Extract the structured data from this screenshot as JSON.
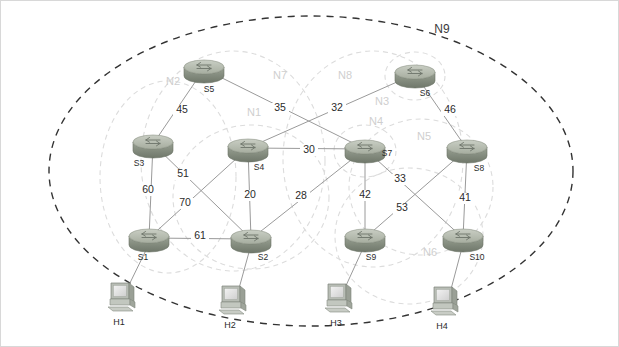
{
  "diagram": {
    "type": "network-graph",
    "outer_zone_label": "N9",
    "colors": {
      "link": "#9a9a9a",
      "zone_dashed": "#dcdcdc",
      "outer_zone_dashed": "#333333",
      "router_body": "#8a9287",
      "router_top": "#b9bfb4",
      "label_text": "#2b2b2b",
      "zone_label_text": "#cfcfcf",
      "background": "#ffffff"
    }
  },
  "routers": [
    {
      "id": "S1",
      "label": "S1",
      "x": 148,
      "y": 237,
      "label_dx": -6,
      "label_dy": 22
    },
    {
      "id": "S2",
      "label": "S2",
      "x": 250,
      "y": 238,
      "label_dx": 12,
      "label_dy": 21
    },
    {
      "id": "S3",
      "label": "S3",
      "x": 152,
      "y": 143,
      "label_dx": -14,
      "label_dy": 22
    },
    {
      "id": "S4",
      "label": "S4",
      "x": 247,
      "y": 147,
      "label_dx": 11,
      "label_dy": 22
    },
    {
      "id": "S5",
      "label": "S5",
      "x": 203,
      "y": 68,
      "label_dx": 5,
      "label_dy": 23
    },
    {
      "id": "S6",
      "label": "S6",
      "x": 414,
      "y": 73,
      "label_dx": 10,
      "label_dy": 22
    },
    {
      "id": "S7",
      "label": "S7",
      "x": 364,
      "y": 148,
      "label_dx": 22,
      "label_dy": 7
    },
    {
      "id": "S8",
      "label": "S8",
      "x": 466,
      "y": 148,
      "label_dx": 12,
      "label_dy": 22
    },
    {
      "id": "S9",
      "label": "S9",
      "x": 364,
      "y": 237,
      "label_dx": 6,
      "label_dy": 22
    },
    {
      "id": "S10",
      "label": "S10",
      "x": 462,
      "y": 237,
      "label_dx": 14,
      "label_dy": 22
    }
  ],
  "hosts": [
    {
      "id": "H1",
      "label": "H1",
      "x": 120,
      "y": 296,
      "label_dx": -2,
      "label_dy": 28
    },
    {
      "id": "H2",
      "label": "H2",
      "x": 231,
      "y": 299,
      "label_dx": -2,
      "label_dy": 28
    },
    {
      "id": "H3",
      "label": "H3",
      "x": 337,
      "y": 297,
      "label_dx": -2,
      "label_dy": 28
    },
    {
      "id": "H4",
      "label": "H4",
      "x": 443,
      "y": 300,
      "label_dx": -2,
      "label_dy": 28
    }
  ],
  "links": [
    {
      "from": "S3",
      "to": "S5",
      "weight": "45",
      "lx": 181,
      "ly": 112
    },
    {
      "from": "S5",
      "to": "S7",
      "weight": "35",
      "lx": 279,
      "ly": 110
    },
    {
      "from": "S4",
      "to": "S6",
      "weight": "32",
      "lx": 336,
      "ly": 110
    },
    {
      "from": "S4",
      "to": "S7",
      "weight": "30",
      "lx": 308,
      "ly": 152
    },
    {
      "from": "S6",
      "to": "S8",
      "weight": "46",
      "lx": 449,
      "ly": 112
    },
    {
      "from": "S3",
      "to": "S1",
      "weight": "60",
      "lx": 147,
      "ly": 192
    },
    {
      "from": "S3",
      "to": "S2",
      "weight": "51",
      "lx": 182,
      "ly": 176
    },
    {
      "from": "S4",
      "to": "S1",
      "weight": "70",
      "lx": 184,
      "ly": 205
    },
    {
      "from": "S4",
      "to": "S2",
      "weight": "20",
      "lx": 249,
      "ly": 197
    },
    {
      "from": "S1",
      "to": "S2",
      "weight": "61",
      "lx": 199,
      "ly": 238
    },
    {
      "from": "S2",
      "to": "S7",
      "weight": "28",
      "lx": 300,
      "ly": 198
    },
    {
      "from": "S7",
      "to": "S9",
      "weight": "42",
      "lx": 364,
      "ly": 197
    },
    {
      "from": "S7",
      "to": "S10",
      "weight": "33",
      "lx": 399,
      "ly": 181
    },
    {
      "from": "S8",
      "to": "S9",
      "weight": "53",
      "lx": 401,
      "ly": 210
    },
    {
      "from": "S8",
      "to": "S10",
      "weight": "41",
      "lx": 464,
      "ly": 200
    }
  ],
  "host_links": [
    {
      "from": "S1",
      "to": "H1"
    },
    {
      "from": "S2",
      "to": "H2"
    },
    {
      "from": "S9",
      "to": "H3"
    },
    {
      "from": "S10",
      "to": "H4"
    }
  ],
  "zones": [
    {
      "id": "N1",
      "label": "N1",
      "cx": 250,
      "cy": 196,
      "rx": 78,
      "ry": 72,
      "rot": 0,
      "lx": 253,
      "ly": 115
    },
    {
      "id": "N2",
      "label": "N2",
      "cx": 167,
      "cy": 176,
      "rx": 68,
      "ry": 96,
      "rot": 0,
      "lx": 172,
      "ly": 84
    },
    {
      "id": "N3",
      "label": "N3",
      "cx": 414,
      "cy": 75,
      "rx": 30,
      "ry": 24,
      "rot": 0,
      "lx": 381,
      "ly": 104
    },
    {
      "id": "N4",
      "label": "N4",
      "cx": 364,
      "cy": 150,
      "rx": 31,
      "ry": 26,
      "rot": 0,
      "lx": 375,
      "ly": 124
    },
    {
      "id": "N5",
      "label": "N5",
      "cx": 420,
      "cy": 186,
      "rx": 72,
      "ry": 68,
      "rot": 0,
      "lx": 423,
      "ly": 139
    },
    {
      "id": "N6",
      "label": "N6",
      "cx": 408,
      "cy": 235,
      "rx": 74,
      "ry": 68,
      "rot": 0,
      "lx": 429,
      "ly": 255
    },
    {
      "id": "N7",
      "label": "N7",
      "cx": 232,
      "cy": 160,
      "rx": 92,
      "ry": 110,
      "rot": 0,
      "lx": 279,
      "ly": 78
    },
    {
      "id": "N8",
      "label": "N8",
      "cx": 372,
      "cy": 158,
      "rx": 90,
      "ry": 108,
      "rot": 0,
      "lx": 344,
      "ly": 78
    }
  ],
  "outer_zone": {
    "label": "N9",
    "cx": 310,
    "cy": 170,
    "rx": 262,
    "ry": 155,
    "lx": 441,
    "ly": 32
  }
}
